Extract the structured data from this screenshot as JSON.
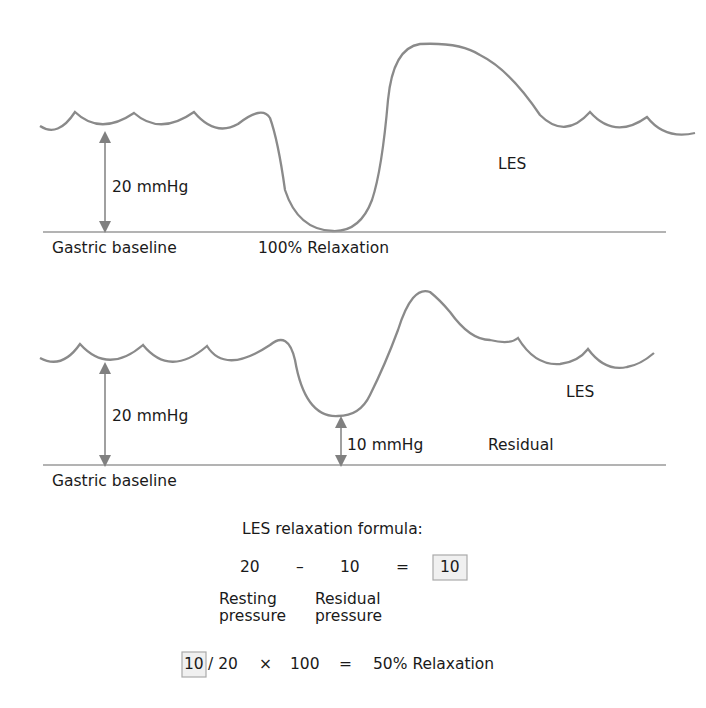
{
  "panels": [
    {
      "id": "full-relaxation",
      "value_label": "20 mmHg",
      "baseline_label": "Gastric baseline",
      "trough_label": "100% Relaxation",
      "curve_label": "LES"
    },
    {
      "id": "partial-relaxation",
      "value_label": "20 mmHg",
      "residual_value_label": "10 mmHg",
      "residual_label": "Residual",
      "baseline_label": "Gastric baseline",
      "curve_label": "LES"
    }
  ],
  "formula": {
    "title": "LES relaxation formula:",
    "resting_value": "20",
    "minus": "–",
    "residual_value": "10",
    "equals": "=",
    "result": "10",
    "resting_caption_1": "Resting",
    "resting_caption_2": "pressure",
    "residual_caption_1": "Residual",
    "residual_caption_2": "pressure",
    "final_numerator": "10",
    "final_rest": "/ 20",
    "times": "×",
    "hundred": "100",
    "final_equals": "=",
    "final_result": "50% Relaxation"
  },
  "colors": {
    "curve": "#8a8a8a",
    "baseline": "#9a9a9a",
    "text": "#1a1a1a",
    "highlight_box": "#f0f0f0"
  }
}
